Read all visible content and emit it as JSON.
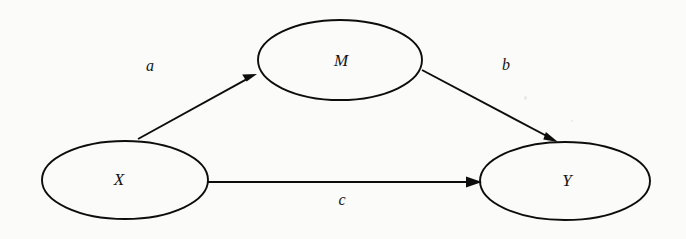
{
  "diagram": {
    "type": "path-diagram",
    "background_color": "#fbfbfa",
    "stroke_color": "#0d0d0d",
    "text_color": "#151515",
    "canvas": {
      "width": 686,
      "height": 239
    },
    "nodes": [
      {
        "id": "X",
        "label": "X",
        "role": "independent-variable",
        "cx": 125,
        "cy": 180,
        "rx": 83,
        "ry": 39
      },
      {
        "id": "M",
        "label": "M",
        "role": "mediator-variable",
        "cx": 340,
        "cy": 60,
        "rx": 82,
        "ry": 40
      },
      {
        "id": "Y",
        "label": "Y",
        "role": "dependent-variable",
        "cx": 565,
        "cy": 181,
        "rx": 85,
        "ry": 39
      }
    ],
    "edges": [
      {
        "id": "a",
        "label": "a",
        "from": "X",
        "to": "M",
        "x1": 138,
        "y1": 139,
        "x2": 257,
        "y2": 74,
        "label_x": 150,
        "label_y": 67
      },
      {
        "id": "b",
        "label": "b",
        "from": "M",
        "to": "Y",
        "x1": 422,
        "y1": 70,
        "x2": 558,
        "y2": 142,
        "label_x": 506,
        "label_y": 66
      },
      {
        "id": "c",
        "label": "c",
        "from": "X",
        "to": "Y",
        "x1": 208,
        "y1": 182,
        "x2": 482,
        "y2": 182,
        "label_x": 342,
        "label_y": 201
      }
    ]
  }
}
